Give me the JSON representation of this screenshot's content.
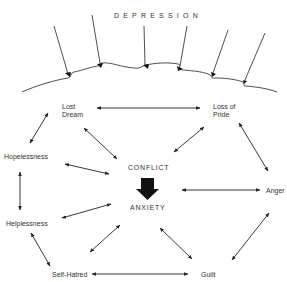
{
  "diagram": {
    "title": "DEPRESSION",
    "nodes": {
      "lost_dream": "Lost\nDream",
      "loss_of_pride": "Loss of\nPride",
      "hopelessness": "Hopelessness",
      "conflict": "CONFLICT",
      "anxiety": "ANXIETY",
      "anger": "Anger",
      "helplessness": "Helplessness",
      "self_hatred": "Self-Hatred",
      "guilt": "Guilt"
    },
    "edges": [
      {
        "from": "Lost Dream",
        "to": "Loss of Pride",
        "type": "bidirectional"
      },
      {
        "from": "Lost Dream",
        "to": "Hopelessness",
        "type": "bidirectional"
      },
      {
        "from": "Lost Dream",
        "to": "CONFLICT",
        "type": "bidirectional"
      },
      {
        "from": "Loss of Pride",
        "to": "CONFLICT",
        "type": "bidirectional"
      },
      {
        "from": "Loss of Pride",
        "to": "Anger",
        "type": "bidirectional"
      },
      {
        "from": "Hopelessness",
        "to": "CONFLICT",
        "type": "bidirectional"
      },
      {
        "from": "Hopelessness",
        "to": "Helplessness",
        "type": "bidirectional"
      },
      {
        "from": "CONFLICT",
        "to": "ANXIETY",
        "type": "heavy-directed"
      },
      {
        "from": "ANXIETY",
        "to": "Anger",
        "type": "bidirectional"
      },
      {
        "from": "ANXIETY",
        "to": "Helplessness",
        "type": "bidirectional"
      },
      {
        "from": "ANXIETY",
        "to": "Self-Hatred",
        "type": "bidirectional"
      },
      {
        "from": "ANXIETY",
        "to": "Guilt",
        "type": "bidirectional"
      },
      {
        "from": "Helplessness",
        "to": "Self-Hatred",
        "type": "bidirectional"
      },
      {
        "from": "Self-Hatred",
        "to": "Guilt",
        "type": "bidirectional"
      },
      {
        "from": "Guilt",
        "to": "Anger",
        "type": "bidirectional"
      }
    ]
  }
}
